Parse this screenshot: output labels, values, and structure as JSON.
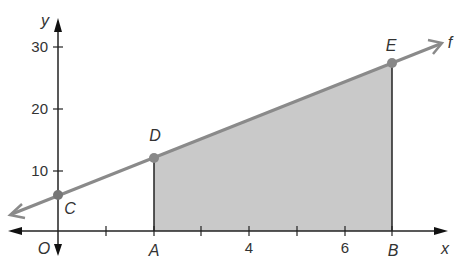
{
  "figure": {
    "axis_labels": {
      "x": "x",
      "y": "y",
      "origin": "O"
    },
    "x_ticks": [
      {
        "value": 4,
        "label": "4"
      },
      {
        "value": 6,
        "label": "6"
      }
    ],
    "y_ticks": [
      {
        "value": 10,
        "label": "10"
      },
      {
        "value": 20,
        "label": "20"
      },
      {
        "value": 30,
        "label": "30"
      }
    ],
    "function_label": "f",
    "points": {
      "A": {
        "label": "A",
        "x": 2,
        "y": 0
      },
      "B": {
        "label": "B",
        "x": 7,
        "y": 0
      },
      "C": {
        "label": "C",
        "x": 0,
        "y": 6
      },
      "D": {
        "label": "D",
        "x": 2,
        "y": 12
      },
      "E": {
        "label": "E",
        "x": 7,
        "y": 27
      }
    },
    "colors": {
      "line": "#8a8a8a",
      "shade": "#c8c8c8",
      "axis": "#222222",
      "point": "#7a7a7a"
    }
  }
}
